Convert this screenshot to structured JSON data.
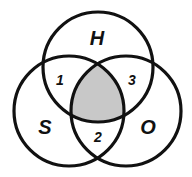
{
  "diagram": {
    "type": "venn",
    "circles": [
      {
        "label": "H",
        "position": "top"
      },
      {
        "label": "S",
        "position": "bottom-left"
      },
      {
        "label": "O",
        "position": "bottom-right"
      }
    ],
    "regions": [
      {
        "label": "1",
        "between": [
          "H",
          "S"
        ]
      },
      {
        "label": "2",
        "between": [
          "S",
          "O"
        ]
      },
      {
        "label": "3",
        "between": [
          "H",
          "O"
        ]
      }
    ],
    "shaded_region": "H ∩ S ∩ O",
    "colors": {
      "stroke": "#111111",
      "shade": "#c8c8c8",
      "background": "#ffffff"
    }
  }
}
